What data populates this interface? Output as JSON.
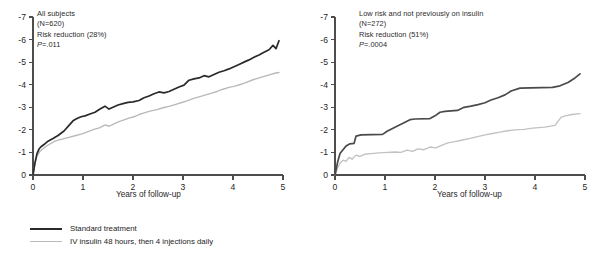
{
  "figure": {
    "panel_count": 2
  },
  "legend": {
    "items": [
      {
        "key": "standard",
        "label": "Standard treatment",
        "color": "#2a2a2a"
      },
      {
        "key": "insulin",
        "label": "IV insulin 48 hours, then 4 injections daily",
        "color": "#b9b9b9"
      }
    ]
  },
  "panels": {
    "left": {
      "annotation": {
        "line1": "All subjects",
        "line2": "(N=620)",
        "line3": "Risk reduction (28%)",
        "line4_prefix": "P",
        "line4_rest": "=.011"
      },
      "xlabel": "Years of follow-up",
      "yticks": [
        "0",
        "-1",
        "-2",
        "-3",
        "-4",
        "-5",
        "-6",
        "-7"
      ],
      "xticks": [
        "0",
        "1",
        "2",
        "3",
        "4",
        "5"
      ]
    },
    "right": {
      "annotation": {
        "line1": "Low risk and not previously on insulin",
        "line2": "(N=272)",
        "line3": "Risk reduction (51%)",
        "line4_prefix": "P",
        "line4_rest": "=.0004"
      },
      "xlabel": "Years of follow-up",
      "yticks": [
        "0",
        "-1",
        "-2",
        "-3",
        "-4",
        "-5",
        "-6",
        "-7"
      ],
      "xticks": [
        "0",
        "1",
        "2",
        "3",
        "4",
        "5"
      ]
    }
  },
  "chart_data": [
    {
      "id": "left-panel",
      "type": "line",
      "title": "All subjects",
      "subtitle": "(N=620) Risk reduction (28%) P=.011",
      "xlabel": "Years of follow-up",
      "ylabel": "",
      "xlim": [
        0,
        5
      ],
      "ylim": [
        0,
        -7
      ],
      "y_axis_inverted": true,
      "xticks": [
        0,
        1,
        2,
        3,
        4,
        5
      ],
      "yticks": [
        0,
        -1,
        -2,
        -3,
        -4,
        -5,
        -6,
        -7
      ],
      "grid": false,
      "legend_position": "below-figure",
      "annotations": {
        "n": 620,
        "risk_reduction_pct": 28,
        "p_value": ".011"
      },
      "series": [
        {
          "name": "Standard treatment",
          "color": "#2a2a2a",
          "x": [
            0.0,
            0.04,
            0.08,
            0.12,
            0.16,
            0.22,
            0.3,
            0.4,
            0.5,
            0.62,
            0.72,
            0.8,
            0.88,
            0.96,
            1.04,
            1.14,
            1.24,
            1.34,
            1.44,
            1.52,
            1.6,
            1.7,
            1.8,
            1.9,
            2.0,
            2.12,
            2.22,
            2.32,
            2.42,
            2.52,
            2.62,
            2.72,
            2.82,
            2.92,
            3.02,
            3.12,
            3.22,
            3.32,
            3.42,
            3.52,
            3.62,
            3.72,
            3.82,
            3.92,
            4.02,
            4.12,
            4.22,
            4.32,
            4.42,
            4.52,
            4.62,
            4.72,
            4.8,
            4.86,
            4.92
          ],
          "y": [
            0.0,
            -0.55,
            -0.95,
            -1.15,
            -1.25,
            -1.35,
            -1.5,
            -1.62,
            -1.75,
            -1.95,
            -2.2,
            -2.4,
            -2.5,
            -2.58,
            -2.62,
            -2.7,
            -2.78,
            -2.92,
            -3.05,
            -2.92,
            -3.0,
            -3.1,
            -3.16,
            -3.22,
            -3.24,
            -3.3,
            -3.42,
            -3.5,
            -3.6,
            -3.68,
            -3.64,
            -3.7,
            -3.8,
            -3.9,
            -3.98,
            -4.2,
            -4.26,
            -4.3,
            -4.4,
            -4.35,
            -4.45,
            -4.55,
            -4.62,
            -4.7,
            -4.8,
            -4.9,
            -5.0,
            -5.1,
            -5.22,
            -5.32,
            -5.44,
            -5.55,
            -5.74,
            -5.6,
            -5.95
          ]
        },
        {
          "name": "IV insulin 48 hours, then 4 injections daily",
          "color": "#b9b9b9",
          "x": [
            0.0,
            0.04,
            0.08,
            0.14,
            0.22,
            0.32,
            0.44,
            0.56,
            0.7,
            0.84,
            0.98,
            1.1,
            1.22,
            1.34,
            1.44,
            1.52,
            1.62,
            1.72,
            1.82,
            1.92,
            2.02,
            2.12,
            2.24,
            2.36,
            2.48,
            2.6,
            2.72,
            2.84,
            2.96,
            3.08,
            3.2,
            3.32,
            3.44,
            3.56,
            3.68,
            3.8,
            3.92,
            4.04,
            4.16,
            4.28,
            4.4,
            4.52,
            4.64,
            4.76,
            4.86,
            4.92
          ],
          "y": [
            0.0,
            -0.5,
            -0.85,
            -1.05,
            -1.2,
            -1.35,
            -1.5,
            -1.58,
            -1.66,
            -1.74,
            -1.82,
            -1.92,
            -2.02,
            -2.1,
            -2.22,
            -2.16,
            -2.26,
            -2.36,
            -2.44,
            -2.52,
            -2.58,
            -2.68,
            -2.76,
            -2.84,
            -2.9,
            -2.98,
            -3.04,
            -3.12,
            -3.2,
            -3.28,
            -3.38,
            -3.46,
            -3.54,
            -3.62,
            -3.7,
            -3.8,
            -3.88,
            -3.94,
            -4.02,
            -4.12,
            -4.22,
            -4.3,
            -4.38,
            -4.46,
            -4.52,
            -4.54
          ]
        }
      ]
    },
    {
      "id": "right-panel",
      "type": "line",
      "title": "Low risk and not previously on insulin",
      "subtitle": "(N=272) Risk reduction (51%) P=.0004",
      "xlabel": "Years of follow-up",
      "ylabel": "",
      "xlim": [
        0,
        5
      ],
      "ylim": [
        0,
        -7
      ],
      "y_axis_inverted": true,
      "xticks": [
        0,
        1,
        2,
        3,
        4,
        5
      ],
      "yticks": [
        0,
        -1,
        -2,
        -3,
        -4,
        -5,
        -6,
        -7
      ],
      "grid": false,
      "legend_position": "below-figure",
      "annotations": {
        "n": 272,
        "risk_reduction_pct": 51,
        "p_value": ".0004"
      },
      "series": [
        {
          "name": "Standard treatment",
          "color": "#4a4a4a",
          "x": [
            0.0,
            0.05,
            0.1,
            0.16,
            0.22,
            0.3,
            0.38,
            0.42,
            0.52,
            0.95,
            1.05,
            1.2,
            1.35,
            1.5,
            1.6,
            1.9,
            2.0,
            2.1,
            2.2,
            2.32,
            2.45,
            2.58,
            2.72,
            2.86,
            3.0,
            3.12,
            3.26,
            3.4,
            3.52,
            3.7,
            4.35,
            4.5,
            4.66,
            4.8,
            4.9
          ],
          "y": [
            0.0,
            -0.55,
            -0.95,
            -1.12,
            -1.28,
            -1.38,
            -1.4,
            -1.72,
            -1.78,
            -1.8,
            -1.95,
            -2.12,
            -2.28,
            -2.45,
            -2.48,
            -2.5,
            -2.62,
            -2.78,
            -2.82,
            -2.84,
            -2.86,
            -3.0,
            -3.05,
            -3.12,
            -3.2,
            -3.32,
            -3.42,
            -3.55,
            -3.72,
            -3.85,
            -3.88,
            -3.95,
            -4.1,
            -4.3,
            -4.48
          ]
        },
        {
          "name": "IV insulin 48 hours, then 4 injections daily",
          "color": "#c2c2c2",
          "x": [
            0.0,
            0.05,
            0.1,
            0.16,
            0.22,
            0.28,
            0.34,
            0.42,
            0.5,
            0.6,
            0.72,
            0.88,
            1.05,
            1.2,
            1.32,
            1.44,
            1.55,
            1.66,
            1.78,
            1.9,
            2.02,
            2.14,
            2.26,
            2.4,
            2.55,
            2.7,
            2.85,
            3.0,
            3.15,
            3.3,
            3.45,
            3.6,
            3.78,
            3.95,
            4.2,
            4.4,
            4.52,
            4.6,
            4.74,
            4.9
          ],
          "y": [
            0.0,
            -0.3,
            -0.52,
            -0.66,
            -0.6,
            -0.78,
            -0.7,
            -0.88,
            -0.82,
            -0.92,
            -0.95,
            -0.98,
            -1.0,
            -1.02,
            -1.0,
            -1.1,
            -1.05,
            -1.16,
            -1.12,
            -1.24,
            -1.2,
            -1.32,
            -1.42,
            -1.48,
            -1.55,
            -1.62,
            -1.7,
            -1.78,
            -1.84,
            -1.9,
            -1.96,
            -2.0,
            -2.02,
            -2.08,
            -2.12,
            -2.2,
            -2.55,
            -2.62,
            -2.68,
            -2.72
          ]
        }
      ]
    }
  ]
}
